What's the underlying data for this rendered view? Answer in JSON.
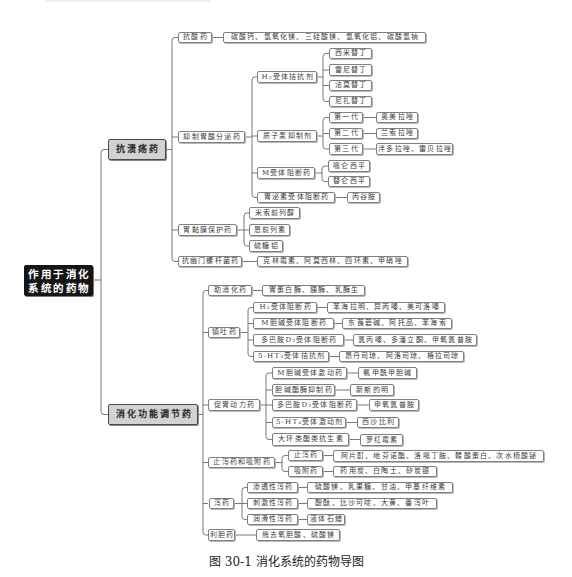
{
  "figure": {
    "caption": "图 30-1  消化系统的药物导图"
  },
  "root": {
    "line1": "作用于消化",
    "line2": "系统的药物"
  },
  "branches": [
    {
      "label": "抗溃疡药",
      "children": [
        {
          "label": "抗酸药",
          "drugs": "碳酸钙、氢氧化镁、三硅酸镁、氢氧化铝、碳酸氢钠"
        },
        {
          "label": "抑制胃酸分泌药",
          "children": [
            {
              "label": "H₂受体拮抗剂",
              "children": [
                {
                  "label": "西米替丁"
                },
                {
                  "label": "雷尼替丁"
                },
                {
                  "label": "法莫替丁"
                },
                {
                  "label": "尼扎替丁"
                }
              ]
            },
            {
              "label": "质子泵抑制剂",
              "children": [
                {
                  "label": "第一代",
                  "drugs": "奥美拉唑"
                },
                {
                  "label": "第二代",
                  "drugs": "兰索拉唑"
                },
                {
                  "label": "第三代",
                  "drugs": "泮多拉唑、雷贝拉唑"
                }
              ]
            },
            {
              "label": "M受体阻断药",
              "children": [
                {
                  "label": "哌仑西平"
                },
                {
                  "label": "替仑西平"
                }
              ]
            },
            {
              "label": "胃泌素受体阻断药",
              "drugs": "丙谷胺"
            }
          ]
        },
        {
          "label": "胃黏膜保护药",
          "children": [
            {
              "label": "米索前列醇"
            },
            {
              "label": "恩前列素"
            },
            {
              "label": "硫糖铝"
            }
          ]
        },
        {
          "label": "抗幽门螺杆菌药",
          "drugs": "克林霉素、阿莫西林、四环素、甲硝唑"
        }
      ]
    },
    {
      "label": "消化功能调节药",
      "children": [
        {
          "label": "助消化药",
          "drugs": "胃蛋白酶、胰酶、乳酶生"
        },
        {
          "label": "镇吐药",
          "children": [
            {
              "label": "H₁受体阻断药",
              "drugs": "苯海拉明、异丙嗪、美可洛嗪"
            },
            {
              "label": "M胆碱受体阻断药",
              "drugs": "东莨菪碱、阿托品、苯海索"
            },
            {
              "label": "多巴胺D₂受体阻断药",
              "drugs": "氯丙嗪、多潘立酮、甲氧氯普胺"
            },
            {
              "label": "5-HT₃受体拮抗剂",
              "drugs": "昂丹司琼、阿洛司琼、格拉司琼"
            }
          ]
        },
        {
          "label": "促胃动力药",
          "children": [
            {
              "label": "M胆碱受体激动药",
              "drugs": "氨甲酰甲胆碱"
            },
            {
              "label": "胆碱酯酶抑制药",
              "drugs": "新斯的明"
            },
            {
              "label": "多巴胺D₂受体阻断药",
              "drugs": "甲氧氯普胺"
            },
            {
              "label": "5-HT₄受体激动剂",
              "drugs": "西沙比利"
            },
            {
              "label": "大环类酯类抗生素",
              "drugs": "罗红霉素"
            }
          ]
        },
        {
          "label": "止泻药和吸附药",
          "children": [
            {
              "label": "止泻药",
              "drugs": "阿片酊、地芬诺酯、洛哌丁胺、鞣酸蛋白、次水杨酸铋"
            },
            {
              "label": "吸附药",
              "drugs": "药用炭、白陶土、矽炭银"
            }
          ]
        },
        {
          "label": "泻药",
          "children": [
            {
              "label": "渗透性泻药",
              "drugs": "硫酸镁、乳果糖、甘油、甲基纤维素"
            },
            {
              "label": "刺激性泻药",
              "drugs": "酚酞、比沙可啶、大黄、番泻叶"
            },
            {
              "label": "润滑性泻药",
              "drugs": "液体石蜡"
            }
          ]
        },
        {
          "label": "利胆药",
          "drugs": "熊去氧胆酸、硫酸镁"
        }
      ]
    }
  ]
}
